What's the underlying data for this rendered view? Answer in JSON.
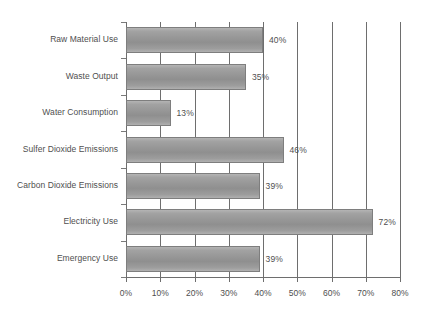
{
  "chart_data": {
    "type": "bar",
    "orientation": "horizontal",
    "title": "",
    "subtitle": "",
    "xlabel": "",
    "ylabel": "",
    "xlim": [
      0,
      80
    ],
    "xtick_labels": [
      "0%",
      "10%",
      "20%",
      "30%",
      "40%",
      "50%",
      "60%",
      "70%",
      "80%"
    ],
    "xticks": [
      0,
      10,
      20,
      30,
      40,
      50,
      60,
      70,
      80
    ],
    "grid": true,
    "grid_axis": "x",
    "legend": false,
    "legend_position": "none",
    "categories": [
      "Raw Material Use",
      "Waste Output",
      "Water Consumption",
      "Sulfer Dioxide Emissions",
      "Carbon Dioxide Emissions",
      "Electricity Use",
      "Emergency Use"
    ],
    "values": [
      40,
      35,
      13,
      46,
      39,
      72,
      39
    ],
    "value_labels": [
      "40%",
      "35%",
      "13%",
      "46%",
      "39%",
      "72%",
      "39%"
    ],
    "bar_color": "#9a9a9a",
    "bar_border_color": "#7e7e7e",
    "axis_color": "#6e6e6e",
    "text_color": "#4f4f4f",
    "background_color": "#ffffff"
  }
}
